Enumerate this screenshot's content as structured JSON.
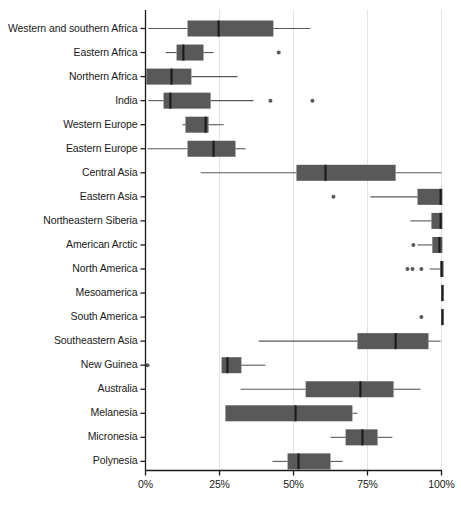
{
  "chart_data": {
    "type": "box",
    "title": "",
    "xlabel": "",
    "ylabel": "",
    "xlim": [
      0,
      100
    ],
    "xticks": [
      0,
      25,
      50,
      75,
      100
    ],
    "xticklabels": [
      "0%",
      "25%",
      "50%",
      "75%",
      "100%"
    ],
    "grid": "vertical",
    "legend": "none",
    "orientation": "horizontal",
    "box_color": "#595959",
    "median_color": "#1a1a1a",
    "whisker_color": "#595959",
    "axis_color": "#1a1a1a",
    "categories": [
      "Western and southern Africa",
      "Eastern Africa",
      "Northern Africa",
      "India",
      "Western Europe",
      "Eastern Europe",
      "Central Asia",
      "Eastern Asia",
      "Northeastern Siberia",
      "American Arctic",
      "North America",
      "Mesoamerica",
      "South America",
      "Southeastern Asia",
      "New Guinea",
      "Australia",
      "Melanesia",
      "Micronesia",
      "Polynesia"
    ],
    "boxes": [
      {
        "category": "Western and southern Africa",
        "whisker_low": 1.0,
        "q1": 14.2,
        "median": 24.7,
        "q3": 43.2,
        "whisker_high": 55.7,
        "outliers": []
      },
      {
        "category": "Eastern Africa",
        "whisker_low": 6.8,
        "q1": 10.5,
        "median": 12.8,
        "q3": 19.6,
        "whisker_high": 23.0,
        "outliers": [
          45.0
        ]
      },
      {
        "category": "Northern Africa",
        "whisker_low": 0.3,
        "q1": 0.3,
        "median": 8.8,
        "q3": 15.5,
        "whisker_high": 31.1,
        "outliers": []
      },
      {
        "category": "India",
        "whisker_low": 1.0,
        "q1": 6.1,
        "median": 8.4,
        "q3": 22.0,
        "whisker_high": 36.5,
        "outliers": [
          42.2,
          56.4
        ]
      },
      {
        "category": "Western Europe",
        "whisker_low": 12.5,
        "q1": 13.5,
        "median": 20.3,
        "q3": 21.3,
        "whisker_high": 26.4,
        "outliers": []
      },
      {
        "category": "Eastern Europe",
        "whisker_low": 0.7,
        "q1": 14.2,
        "median": 23.0,
        "q3": 30.4,
        "whisker_high": 33.8,
        "outliers": []
      },
      {
        "category": "Central Asia",
        "whisker_low": 18.6,
        "q1": 51.0,
        "median": 60.8,
        "q3": 84.5,
        "whisker_high": 100.0,
        "outliers": []
      },
      {
        "category": "Eastern Asia",
        "whisker_low": 76.0,
        "q1": 91.9,
        "median": 99.7,
        "q3": 100.3,
        "whisker_high": 100.3,
        "outliers": [
          63.5
        ]
      },
      {
        "category": "Northeastern Siberia",
        "whisker_low": 89.5,
        "q1": 96.6,
        "median": 99.7,
        "q3": 100.3,
        "whisker_high": 100.3,
        "outliers": []
      },
      {
        "category": "American Arctic",
        "whisker_low": 91.9,
        "q1": 96.9,
        "median": 99.3,
        "q3": 100.3,
        "whisker_high": 100.3,
        "outliers": [
          90.5
        ]
      },
      {
        "category": "North America",
        "whisker_low": 96.0,
        "q1": 99.7,
        "median": 100.0,
        "q3": 100.7,
        "whisker_high": 100.7,
        "outliers": [
          88.5,
          90.2,
          93.2
        ]
      },
      {
        "category": "Mesoamerica",
        "whisker_low": 100.0,
        "q1": 100.0,
        "median": 100.3,
        "q3": 100.7,
        "whisker_high": 100.7,
        "outliers": []
      },
      {
        "category": "South America",
        "whisker_low": 100.0,
        "q1": 100.0,
        "median": 100.3,
        "q3": 100.7,
        "whisker_high": 100.7,
        "outliers": [
          93.2
        ]
      },
      {
        "category": "Southeastern Asia",
        "whisker_low": 38.2,
        "q1": 71.6,
        "median": 84.5,
        "q3": 95.6,
        "whisker_high": 99.7,
        "outliers": []
      },
      {
        "category": "New Guinea",
        "whisker_low": 25.7,
        "q1": 25.7,
        "median": 27.7,
        "q3": 32.4,
        "whisker_high": 40.5,
        "outliers": [
          0.7
        ]
      },
      {
        "category": "Australia",
        "whisker_low": 32.1,
        "q1": 54.1,
        "median": 72.6,
        "q3": 83.8,
        "whisker_high": 92.9,
        "outliers": []
      },
      {
        "category": "Melanesia",
        "whisker_low": 27.0,
        "q1": 27.0,
        "median": 50.7,
        "q3": 69.9,
        "whisker_high": 71.6,
        "outliers": []
      },
      {
        "category": "Micronesia",
        "whisker_low": 62.5,
        "q1": 67.6,
        "median": 73.3,
        "q3": 78.4,
        "whisker_high": 83.4,
        "outliers": []
      },
      {
        "category": "Polynesia",
        "whisker_low": 42.9,
        "q1": 48.0,
        "median": 51.7,
        "q3": 62.5,
        "whisker_high": 66.6,
        "outliers": []
      }
    ]
  },
  "axis": {
    "x_tick_labels": [
      "0%",
      "25%",
      "50%",
      "75%",
      "100%"
    ],
    "y_tick_labels": [
      "Western and southern Africa",
      "Eastern Africa",
      "Northern Africa",
      "India",
      "Western Europe",
      "Eastern Europe",
      "Central Asia",
      "Eastern Asia",
      "Northeastern Siberia",
      "American Arctic",
      "North America",
      "Mesoamerica",
      "South America",
      "Southeastern Asia",
      "New Guinea",
      "Australia",
      "Melanesia",
      "Micronesia",
      "Polynesia"
    ]
  }
}
